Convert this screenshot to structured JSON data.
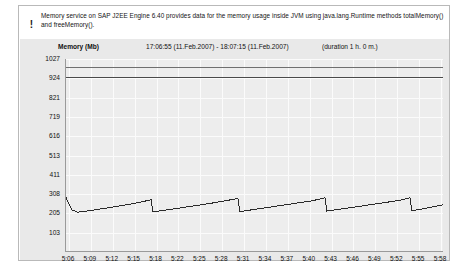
{
  "info": {
    "icon": "exclamation-icon",
    "text": "Memory service on SAP J2EE Engine 6.40 provides data for the memory usage inside JVM using java.lang.Runtime methods totalMemory() and freeMemory()."
  },
  "chart_header": {
    "memory_label": "Memory (Mb)",
    "time_range": "17:06:55  (11.Feb.2007) -  18:07:15  (11.Feb.2007)",
    "duration": "(duration 1 h. 0 m.)"
  },
  "colors": {
    "panel_border": "#b9b9b9",
    "chart_bg": "#e9e9e9",
    "plot_bg": "#ededed",
    "grid": "#fbfbfb",
    "axis": "#9a9a9a",
    "series_total": "#6f6f6f",
    "series_max": "#4a4a4a",
    "series_used": "#2b2b2b"
  },
  "chart_data": {
    "type": "line",
    "title": "Memory (Mb)",
    "subtitle": "17:06:55  (11.Feb.2007) -  18:07:15  (11.Feb.2007)",
    "annotation": "(duration 1 h. 0 m.)",
    "xlabel": "",
    "ylabel": "Memory (Mb)",
    "ylim": [
      0,
      1027
    ],
    "ytick_labels": [
      "1027",
      "924",
      "821",
      "719",
      "616",
      "513",
      "411",
      "308",
      "205",
      "103"
    ],
    "ytick_values": [
      1027,
      924,
      821,
      719,
      616,
      513,
      411,
      308,
      205,
      103
    ],
    "xtick_labels": [
      "5:06",
      "5:09",
      "5:12",
      "5:15",
      "5:18",
      "5:22",
      "5:25",
      "5:28",
      "5:31",
      "5:34",
      "5:37",
      "5:40",
      "5:43",
      "5:46",
      "5:49",
      "5:52",
      "5:55",
      "5:58"
    ],
    "grid": true,
    "legend": "none",
    "series": [
      {
        "name": "Max memory",
        "color": "#6f6f6f",
        "x": [
          0,
          100
        ],
        "values": [
          980,
          980
        ]
      },
      {
        "name": "Total memory",
        "color": "#4a4a4a",
        "x": [
          0,
          100
        ],
        "values": [
          930,
          930
        ]
      },
      {
        "name": "Used memory",
        "color": "#2b2b2b",
        "x": [
          0.0,
          1.5,
          3.0,
          7.0,
          11.0,
          15.0,
          19.0,
          22.5,
          23.0,
          26.0,
          30.0,
          34.0,
          38.0,
          42.0,
          45.5,
          46.0,
          49.0,
          53.0,
          57.0,
          61.0,
          65.0,
          68.5,
          69.0,
          72.0,
          76.0,
          80.0,
          84.0,
          88.0,
          91.0,
          91.5,
          94.5,
          98.0,
          100.0
        ],
        "values": [
          290,
          225,
          212,
          222,
          235,
          248,
          262,
          278,
          213,
          222,
          234,
          246,
          258,
          272,
          285,
          215,
          224,
          236,
          248,
          260,
          272,
          288,
          218,
          227,
          238,
          250,
          262,
          274,
          288,
          220,
          230,
          244,
          252
        ]
      }
    ]
  }
}
